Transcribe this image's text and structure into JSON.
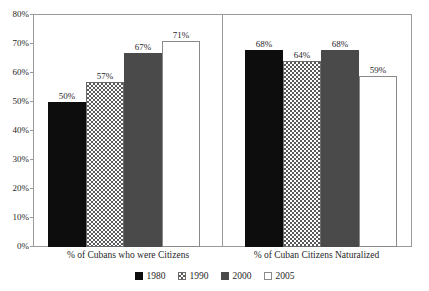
{
  "chart_data": {
    "type": "bar",
    "title": "",
    "subtitle": "",
    "xlabel": "",
    "ylabel": "",
    "ylim": [
      0,
      80
    ],
    "grid": false,
    "legend_position": "bottom-center",
    "categories": [
      "% of Cubans who were Citizens",
      "% of Cuban Citizens Naturalized"
    ],
    "y_ticks": [
      0,
      10,
      20,
      30,
      40,
      50,
      60,
      70,
      80
    ],
    "y_tick_labels": [
      "0%",
      "10%",
      "20%",
      "30%",
      "40%",
      "50%",
      "60%",
      "70%",
      "80%"
    ],
    "series": [
      {
        "name": "1980",
        "values": [
          50,
          57
        ],
        "data_labels": [
          "50%",
          "57%"
        ],
        "fill": "solid-black",
        "color": "#0d0d0d"
      },
      {
        "name": "1990",
        "values": [
          57,
          64
        ],
        "data_labels": [
          "57%",
          "64%"
        ],
        "fill": "checkerboard",
        "color": "#5a5a5a"
      },
      {
        "name": "2000",
        "values": [
          67,
          68
        ],
        "data_labels": [
          "67%",
          "68%"
        ],
        "fill": "solid-darkgray",
        "color": "#4a4a4a"
      },
      {
        "name": "2005",
        "values": [
          71,
          59
        ],
        "data_labels": [
          "71%",
          "59%"
        ],
        "fill": "white-outline",
        "color": "#ffffff"
      }
    ],
    "groups": [
      {
        "category": "% of Cubans who were Citizens",
        "bars": [
          {
            "series": "1980",
            "value": 50,
            "label": "50%"
          },
          {
            "series": "1990",
            "value": 57,
            "label": "57%"
          },
          {
            "series": "2000",
            "value": 67,
            "label": "67%"
          },
          {
            "series": "2005",
            "value": 71,
            "label": "71%"
          }
        ]
      },
      {
        "category": "% of Cuban Citizens Naturalized",
        "bars": [
          {
            "series": "1980",
            "value": 68,
            "label": "68%"
          },
          {
            "series": "1990",
            "value": 64,
            "label": "64%"
          },
          {
            "series": "2000",
            "value": 68,
            "label": "68%"
          },
          {
            "series": "2005",
            "value": 59,
            "label": "59%"
          }
        ]
      }
    ]
  },
  "axis": {
    "y_tick_labels": [
      "80%",
      "70%",
      "60%",
      "50%",
      "40%",
      "30%",
      "20%",
      "10%",
      "0%"
    ]
  },
  "legend": {
    "items": [
      {
        "label": "1980",
        "swatch": "solid-black-swatch"
      },
      {
        "label": "1990",
        "swatch": "checkerboard-swatch"
      },
      {
        "label": "2000",
        "swatch": "solid-darkgray-swatch"
      },
      {
        "label": "2005",
        "swatch": "white-outline-swatch"
      }
    ]
  }
}
